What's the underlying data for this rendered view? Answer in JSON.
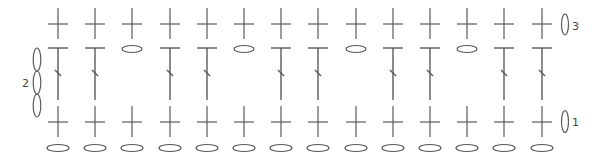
{
  "diagram": {
    "type": "crochet-stitch-chart",
    "stroke_color": "#5a5a5a",
    "columns": 14,
    "column_start_x": 58,
    "column_spacing": 37.2,
    "rows": [
      {
        "row": 1,
        "stitch": "single-crochet",
        "label": "1"
      },
      {
        "row": 2,
        "stitch": "double-crochet",
        "label": "2",
        "turning_chain": 3
      },
      {
        "row": 3,
        "stitch": "single-crochet",
        "label": "3",
        "turning_chain": 1
      }
    ],
    "foundation_chain": "chain",
    "row2_pattern": [
      "dc",
      "dc",
      "ch",
      "dc",
      "dc",
      "ch",
      "dc",
      "dc",
      "ch",
      "dc",
      "dc",
      "ch",
      "dc",
      "dc"
    ],
    "row_labels": {
      "row1": "1",
      "row2": "2",
      "row3": "3"
    }
  }
}
